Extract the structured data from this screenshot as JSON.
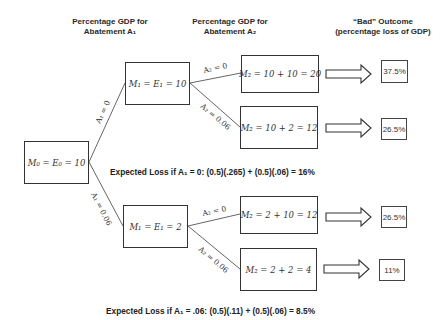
{
  "headers": {
    "abatement_a1": [
      "Percentage GDP for",
      "Abatement A₁"
    ],
    "abatement_a2": [
      "Percentage GDP for",
      "Abatement A₂"
    ],
    "outcome": [
      "“Bad” Outcome",
      "(percentage loss of GDP)"
    ]
  },
  "nodes": {
    "root": "M₀ = E₀ = 10",
    "m1_top": "M₁ = E₁ = 10",
    "m1_bottom": "M₁ = E₁ = 2",
    "m2_tt": "M₂ = 10 + 10 = 20",
    "m2_tb": "M₂ = 10 + 2 = 12",
    "m2_bt": "M₂ = 2 + 10 = 12",
    "m2_bb": "M₂ = 2 + 2 = 4"
  },
  "edges": {
    "a1_zero": "A₁ = 0",
    "a1_006": "A₁ = 0.06",
    "top_a2_zero": "A₂ = 0",
    "top_a2_006": "A₂ = 0.06",
    "bottom_a2_zero": "A₂ = 0",
    "bottom_a2_006": "A₂ = 0.06"
  },
  "outcomes": [
    "37.5%",
    "26.5%",
    "26.5%",
    "11%"
  ],
  "expected_loss": {
    "a1_zero": "Expected Loss if A₁ = 0: (0.5)(.265) + (0.5)(.06) = 16%",
    "a1_006": "Expected Loss if A₁ = .06: (0.5)(.11) + (0.5)(.06) = 8.5%"
  }
}
